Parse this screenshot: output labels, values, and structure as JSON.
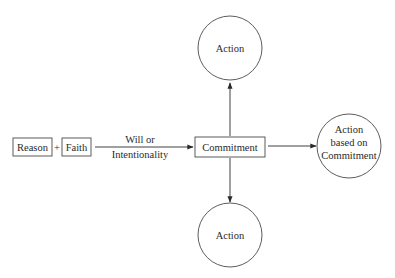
{
  "diagram": {
    "nodes": {
      "reason": {
        "label": "Reason",
        "shape": "box"
      },
      "plus": {
        "label": "+"
      },
      "faith": {
        "label": "Faith",
        "shape": "box"
      },
      "commitment": {
        "label": "Commitment",
        "shape": "box"
      },
      "action_top": {
        "label": "Action",
        "shape": "circle"
      },
      "action_bottom": {
        "label": "Action",
        "shape": "circle"
      },
      "action_right": {
        "lines": [
          "Action",
          "based on",
          "Commitment"
        ],
        "shape": "circle"
      }
    },
    "edges": [
      {
        "from": "faith",
        "to": "commitment",
        "label_lines": [
          "Will or",
          "Intentionality"
        ]
      },
      {
        "from": "commitment",
        "to": "action_top"
      },
      {
        "from": "commitment",
        "to": "action_bottom"
      },
      {
        "from": "commitment",
        "to": "action_right"
      }
    ],
    "colors": {
      "stroke": "#4a4a4a",
      "text": "#2a2a2a",
      "background": "#ffffff"
    }
  }
}
